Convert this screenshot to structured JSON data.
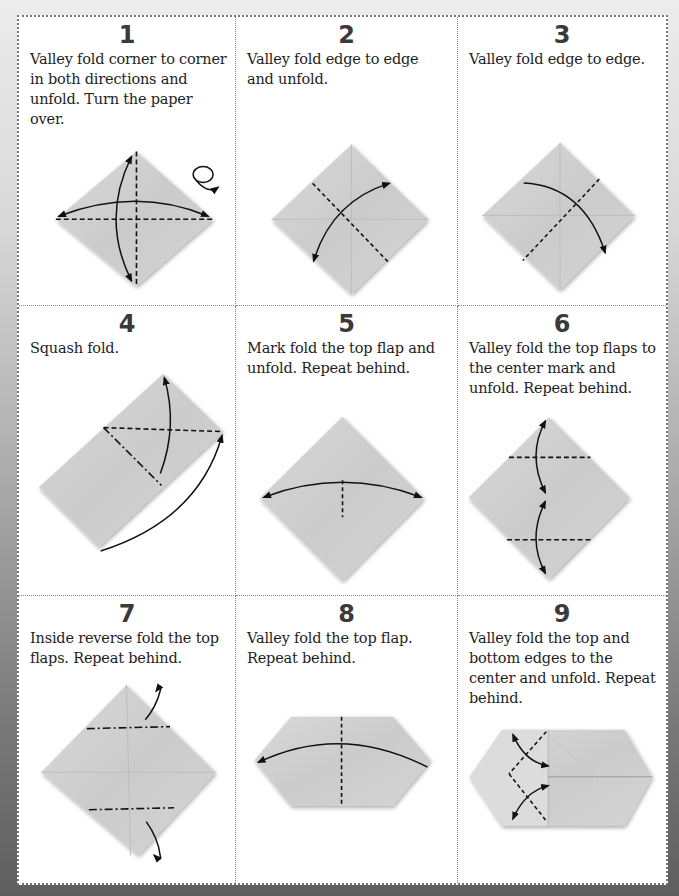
{
  "page": {
    "colors": {
      "paper": "#c9c9c9",
      "line": "#111111",
      "sheet": "#ffffff"
    }
  },
  "steps": [
    {
      "number": "1",
      "text": "Valley fold corner to corner in both directions and unfold. Turn the paper over.",
      "symbols": [
        "valley-fold-lines",
        "double-arrows",
        "turn-over-icon"
      ]
    },
    {
      "number": "2",
      "text": "Valley fold edge to edge and unfold.",
      "symbols": [
        "valley-fold-line",
        "double-arrow"
      ]
    },
    {
      "number": "3",
      "text": "Valley fold edge to edge.",
      "symbols": [
        "valley-fold-line",
        "arrow"
      ]
    },
    {
      "number": "4",
      "text": "Squash fold.",
      "symbols": [
        "valley-fold-line",
        "mountain-fold-line",
        "arrows"
      ]
    },
    {
      "number": "5",
      "text": "Mark fold the top flap and unfold. Repeat behind.",
      "symbols": [
        "mark-fold-line",
        "double-arrow"
      ]
    },
    {
      "number": "6",
      "text": "Valley fold the top flaps to the center mark and unfold. Repeat behind.",
      "symbols": [
        "valley-fold-lines",
        "double-arrows"
      ]
    },
    {
      "number": "7",
      "text": "Inside reverse fold the top flaps. Repeat behind.",
      "symbols": [
        "mountain-fold-lines",
        "reverse-fold-arrows"
      ]
    },
    {
      "number": "8",
      "text": "Valley fold the top flap. Repeat behind.",
      "symbols": [
        "valley-fold-line",
        "arrow"
      ]
    },
    {
      "number": "9",
      "text": "Valley fold the top and bottom edges to the center and unfold. Repeat behind.",
      "symbols": [
        "valley-fold-lines",
        "double-arrows"
      ]
    }
  ]
}
